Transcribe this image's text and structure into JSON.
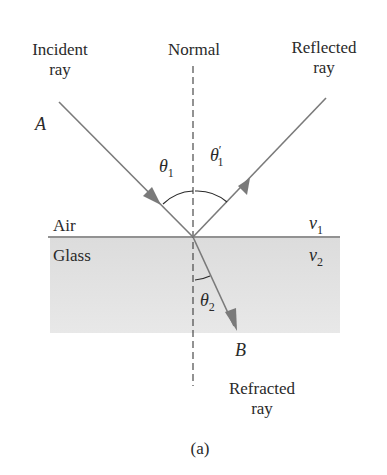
{
  "diagram": {
    "type": "ray-refraction-reflection",
    "labels": {
      "incident": [
        "Incident",
        "ray"
      ],
      "normal": "Normal",
      "reflected": [
        "Reflected",
        "ray"
      ],
      "refracted": [
        "Refracted",
        "ray"
      ],
      "point_a": "A",
      "point_b": "B",
      "medium_top": "Air",
      "medium_bottom": "Glass",
      "v1": "v",
      "v1_sub": "1",
      "v2": "v",
      "v2_sub": "2",
      "theta1": "θ",
      "theta1_sub": "1",
      "theta1p": "θ",
      "theta1p_sup": "′",
      "theta1p_sub": "1",
      "theta2": "θ",
      "theta2_sub": "2",
      "caption": "(a)"
    },
    "colors": {
      "ray": "#7a7a7a",
      "interface": "#6e6e6e",
      "normal": "#3a3a3a",
      "glass_fill": "#e4e4e4",
      "text": "#2a2a2a"
    }
  }
}
